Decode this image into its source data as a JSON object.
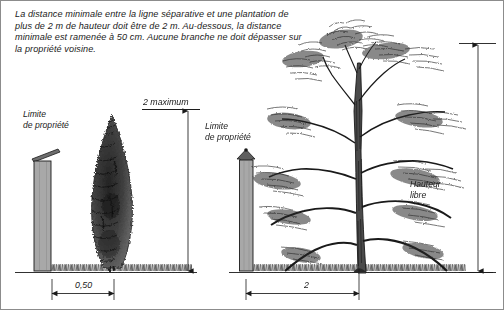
{
  "figure": {
    "caption": "La distance minimale entre la ligne séparative et une plantation de plus de 2 m de hauteur doit être de 2 m. Au-dessous, la distance minimale est ramenée à 50 cm. Aucune branche ne doit dépasser sur la propriété voisine.",
    "border_color": "#8c8c8c",
    "background_color": "#ffffff",
    "ink_color": "#1a1a1a",
    "post_fill_color": "#a8a8a8"
  },
  "left_diagram": {
    "name": "petite-plantation",
    "property_limit_label": "Limite\nde propriété",
    "height_dimension_label": "2 maximum",
    "ground_dimension_label": "0,50",
    "tree_type": "conifer-columnar"
  },
  "right_diagram": {
    "name": "grande-plantation",
    "property_limit_label": "Limite\nde propriété",
    "clearance_label": "Hauteur\nlibre",
    "ground_dimension_label": "2",
    "tree_type": "pine"
  }
}
